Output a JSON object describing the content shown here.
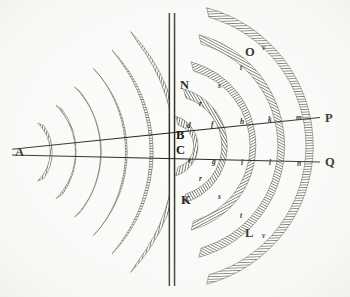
{
  "figure": {
    "background_color": "#fbfbfa",
    "ink_color": "#3a372e",
    "label_color": "#17150f",
    "paper_tone": "#f7f6f2"
  },
  "labels": {
    "source": {
      "text": "A",
      "x": 15,
      "y": 156
    },
    "aperture_top": {
      "text": "B",
      "x": 176,
      "y": 139
    },
    "aperture_bottom": {
      "text": "C",
      "x": 176,
      "y": 154
    },
    "barrier_upper": {
      "text": "N",
      "x": 180,
      "y": 89
    },
    "barrier_lower": {
      "text": "K",
      "x": 181,
      "y": 204
    },
    "ray_upper_end": {
      "text": "P",
      "x": 325,
      "y": 122
    },
    "ray_lower_end": {
      "text": "Q",
      "x": 325,
      "y": 166
    },
    "wave_upper": {
      "text": "O",
      "x": 245,
      "y": 56
    },
    "wave_lower": {
      "text": "L",
      "x": 245,
      "y": 237
    }
  },
  "italic_marks": {
    "upper_ray": [
      {
        "text": "d",
        "x": 187,
        "y": 128
      },
      {
        "text": "f",
        "x": 211,
        "y": 127
      },
      {
        "text": "h",
        "x": 240,
        "y": 124
      },
      {
        "text": "k",
        "x": 268,
        "y": 122
      },
      {
        "text": "m",
        "x": 296,
        "y": 120
      }
    ],
    "lower_ray": [
      {
        "text": "e",
        "x": 188,
        "y": 163
      },
      {
        "text": "g",
        "x": 212,
        "y": 164
      },
      {
        "text": "i",
        "x": 241,
        "y": 165
      },
      {
        "text": "l",
        "x": 269,
        "y": 165
      },
      {
        "text": "n",
        "x": 297,
        "y": 166
      }
    ],
    "upper_arcs": [
      {
        "text": "r",
        "x": 199,
        "y": 106
      },
      {
        "text": "s",
        "x": 218,
        "y": 88
      },
      {
        "text": "t",
        "x": 240,
        "y": 70
      },
      {
        "text": "v",
        "x": 262,
        "y": 50
      }
    ],
    "lower_arcs": [
      {
        "text": "r",
        "x": 199,
        "y": 181
      },
      {
        "text": "s",
        "x": 218,
        "y": 199
      },
      {
        "text": "t",
        "x": 240,
        "y": 218
      },
      {
        "text": "v",
        "x": 262,
        "y": 238
      }
    ]
  },
  "geometry": {
    "source_point": {
      "x": 10,
      "y": 152
    },
    "aperture_center": {
      "x": 172,
      "y": 146
    },
    "aperture_top_point": {
      "x": 172,
      "y": 139
    },
    "aperture_bottom_point": {
      "x": 172,
      "y": 153
    },
    "barrier_x1": 169,
    "barrier_x2": 174.5,
    "barrier_y_top": 13,
    "barrier_y_bottom": 286,
    "ray_upper": {
      "x1": 12,
      "y1": 149,
      "x2": 320,
      "y2": 118
    },
    "ray_lower": {
      "x1": 12,
      "y1": 155,
      "x2": 320,
      "y2": 162
    },
    "incident_arc_radii": [
      40,
      66,
      93,
      120,
      147,
      174
    ],
    "incident_arc_band": 9,
    "incident_arc_half_angle_deg": 46,
    "diffracted_arc_radii": [
      22,
      50,
      78,
      106,
      134
    ],
    "diffracted_arc_band": 9,
    "diffracted_arc_half_angle_deg": 74
  },
  "description": {
    "caption": "Plane wavefronts from A meet the barrier NK and pass through the opening BC, spreading as circular waves O and L toward P and Q."
  }
}
